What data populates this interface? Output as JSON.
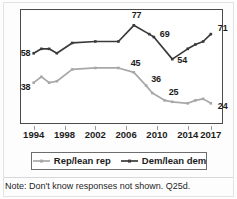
{
  "note": {
    "text": "Note: Don't know responses not shown. Q25d."
  },
  "legend": {
    "items": [
      {
        "label": "Rep/lean rep",
        "color": "#a8a8a8",
        "marker": "square"
      },
      {
        "label": "Dem/lean dem",
        "color": "#3a3a3a",
        "marker": "square"
      }
    ]
  },
  "colors": {
    "dem": "#3a3a3a",
    "rep": "#a8a8a8",
    "frame": "#4a4a4a",
    "text": "#1c1c1c"
  },
  "chart_data": {
    "type": "line",
    "title": "",
    "xlabel": "",
    "ylabel": "",
    "xlim": [
      1993,
      2017.8
    ],
    "ylim": [
      14,
      84
    ],
    "grid": false,
    "legend_position": "bottom",
    "tick_labels": [
      "1994",
      "1998",
      "2002",
      "2006",
      "2010",
      "2014",
      "2017"
    ],
    "tick_values": [
      1994,
      1998,
      2002,
      2006,
      2010,
      2014,
      2017
    ],
    "series": [
      {
        "name": "Dem/lean dem",
        "color": "#3a3a3a",
        "x": [
          1994,
          1995,
          1996,
          1997,
          1999,
          2002,
          2005,
          2007,
          2009,
          2009.6,
          2012,
          2014,
          2015,
          2016,
          2017
        ],
        "values": [
          58,
          61,
          61,
          58,
          65,
          66,
          66,
          77,
          71,
          69,
          54,
          61,
          64,
          66,
          71
        ],
        "point_labels": [
          {
            "x": 1994,
            "value": 58,
            "text": "58"
          },
          {
            "x": 2007,
            "value": 77,
            "text": "77"
          },
          {
            "x": 2009.6,
            "value": 69,
            "text": "69"
          },
          {
            "x": 2012,
            "value": 54,
            "text": "54"
          },
          {
            "x": 2017,
            "value": 71,
            "text": "71"
          }
        ]
      },
      {
        "name": "Rep/lean rep",
        "color": "#a8a8a8",
        "x": [
          1994,
          1995,
          1996,
          1997,
          1999,
          2002,
          2005,
          2007,
          2008.6,
          2009.4,
          2011,
          2012,
          2014,
          2015,
          2016,
          2017
        ],
        "values": [
          38,
          42,
          38,
          39,
          47,
          48,
          48,
          45,
          36,
          31,
          26,
          25,
          24,
          26,
          27,
          24
        ],
        "point_labels": [
          {
            "x": 1994,
            "value": 38,
            "text": "38"
          },
          {
            "x": 2007,
            "value": 45,
            "text": "45"
          },
          {
            "x": 2008.6,
            "value": 36,
            "text": "36"
          },
          {
            "x": 2011,
            "value": 26,
            "text": "25"
          },
          {
            "x": 2017,
            "value": 24,
            "text": "24"
          }
        ]
      }
    ]
  }
}
